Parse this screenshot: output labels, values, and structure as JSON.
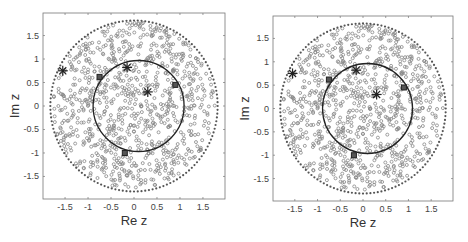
{
  "chart_data": [
    {
      "type": "scatter",
      "title": "",
      "xlabel": "Re z",
      "ylabel": "Im z",
      "xlim": [
        -1.98,
        1.98
      ],
      "ylim": [
        -1.98,
        1.98
      ],
      "grid": false,
      "legend": null,
      "xticks": [
        -1.5,
        -1,
        -0.5,
        0,
        0.5,
        1,
        1.5
      ],
      "xtick_labels": [
        "-1.5",
        "-1",
        "-0.5",
        "0",
        "0.5",
        "1",
        "1.5"
      ],
      "yticks": [
        1.5,
        1,
        0.5,
        0,
        -0.5,
        -1,
        -1.5
      ],
      "ytick_labels": [
        "1.5",
        "1",
        "0.5",
        "0",
        "-0.5",
        "-1",
        "-1.5"
      ],
      "series": [
        {
          "name": "outer boundary (dotted circle)",
          "kind": "dotted-circle",
          "center": [
            0,
            0
          ],
          "radius": 1.82,
          "points": 140,
          "color": "#555555"
        },
        {
          "name": "unit circle",
          "kind": "solid-circle",
          "center": [
            0.1,
            0
          ],
          "radius": 0.99,
          "color": "#222222"
        },
        {
          "name": "random eigenvalues",
          "kind": "open-circles",
          "count": 900,
          "radius_max": 1.78,
          "color": "#888888",
          "seed": 7
        },
        {
          "name": "asterisks",
          "kind": "asterisk",
          "color": "#222222",
          "points": [
            [
              -1.55,
              0.75
            ],
            [
              -0.15,
              0.82
            ],
            [
              0.3,
              0.3
            ]
          ]
        },
        {
          "name": "squares",
          "kind": "square",
          "color": "#222222",
          "points": [
            [
              -0.75,
              0.62
            ],
            [
              0.9,
              0.45
            ],
            [
              -0.2,
              -1.0
            ]
          ]
        }
      ]
    },
    {
      "type": "scatter",
      "title": "",
      "xlabel": "Re z",
      "ylabel": "Im z",
      "xlim": [
        -1.98,
        1.98
      ],
      "ylim": [
        -1.98,
        1.98
      ],
      "grid": false,
      "legend": null,
      "xticks": [
        -1.5,
        -1,
        -0.5,
        0,
        0.5,
        1,
        1.5
      ],
      "xtick_labels": [
        "-1.5",
        "-1",
        "-0.5",
        "0",
        "0.5",
        "1",
        "1.5"
      ],
      "yticks": [
        1.5,
        1,
        0.5,
        0,
        -0.5,
        -1,
        -1.5
      ],
      "ytick_labels": [
        "1.5",
        "1",
        "0.5",
        "0",
        "-0.5",
        "-1",
        "-1.5"
      ],
      "series": [
        {
          "name": "outer boundary (dotted circle)",
          "kind": "dotted-circle",
          "center": [
            0,
            0
          ],
          "radius": 1.82,
          "points": 140,
          "color": "#555555"
        },
        {
          "name": "unit circle",
          "kind": "solid-circle",
          "center": [
            0.1,
            0
          ],
          "radius": 0.99,
          "color": "#222222"
        },
        {
          "name": "random eigenvalues",
          "kind": "open-circles",
          "count": 900,
          "radius_max": 1.78,
          "color": "#888888",
          "seed": 7
        },
        {
          "name": "asterisks",
          "kind": "asterisk",
          "color": "#222222",
          "points": [
            [
              -1.55,
              0.75
            ],
            [
              -0.15,
              0.82
            ],
            [
              0.3,
              0.3
            ]
          ]
        },
        {
          "name": "squares",
          "kind": "square",
          "color": "#222222",
          "points": [
            [
              -0.75,
              0.62
            ],
            [
              0.9,
              0.45
            ],
            [
              -0.2,
              -1.0
            ]
          ]
        }
      ]
    }
  ],
  "panels": [
    {
      "xlabel": "Re z",
      "ylabel": "Im z"
    },
    {
      "xlabel": "Re z",
      "ylabel": "Im z"
    }
  ],
  "layout": {
    "panels_px": [
      {
        "left": 43,
        "top": 13,
        "right": 225,
        "bottom": 199
      },
      {
        "left": 273,
        "top": 16,
        "right": 453,
        "bottom": 201
      }
    ]
  }
}
